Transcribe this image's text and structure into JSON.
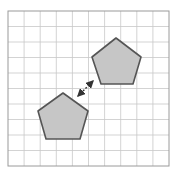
{
  "diagram": {
    "type": "grid-translation",
    "grid": {
      "x": 8,
      "y": 11,
      "width": 161,
      "height": 155,
      "cols": 10,
      "rows": 10,
      "line_color": "#c8c8c8",
      "border_color": "#9a9a9a"
    },
    "shapes": [
      {
        "name": "pentagon-lower",
        "points": "63,93 88,111 80,139 46,139 38,111",
        "fill": "#c6c6c6",
        "stroke": "#555555"
      },
      {
        "name": "pentagon-upper",
        "points": "116,38 141,57 133,84 101,84 92,57",
        "fill": "#c6c6c6",
        "stroke": "#555555"
      }
    ],
    "arrow": {
      "x1": 78,
      "y1": 96,
      "x2": 93,
      "y2": 81,
      "style": "double-headed dashed",
      "color": "#333333"
    }
  }
}
